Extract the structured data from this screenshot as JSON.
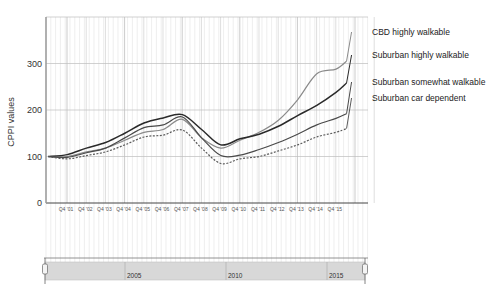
{
  "chart_data": {
    "type": "line",
    "title": "",
    "xlabel": "",
    "ylabel": "CPPI values",
    "ylim": [
      0,
      400
    ],
    "yticks": [
      0,
      100,
      200,
      300
    ],
    "grid": true,
    "legend_position": "right, inline at line ends",
    "x": [
      "Q4 '00",
      "Q4 '01",
      "Q4 '02",
      "Q4 '03",
      "Q4 '04",
      "Q4 '05",
      "Q4 '06",
      "Q4 '07",
      "Q4 '08",
      "Q4 '09",
      "Q4 '10",
      "Q4 '11",
      "Q4 '12",
      "Q4 '13",
      "Q4 '14",
      "Q4 '15",
      "Q2 '16"
    ],
    "xtick_labels": [
      "Q4 '01",
      "Q4 '02",
      "Q4 '03",
      "Q4 '04",
      "Q4 '05",
      "Q4 '06",
      "Q4 '07",
      "Q4 '08",
      "Q4 '09",
      "Q4 '10",
      "Q4 '11",
      "Q4 '12",
      "Q4 '13",
      "Q4 '14",
      "Q4 '15"
    ],
    "series": [
      {
        "name": "CBD highly walkable",
        "style": "solid",
        "color": "#8a8a8a",
        "values": [
          100,
          100,
          110,
          118,
          135,
          152,
          158,
          180,
          140,
          118,
          135,
          152,
          178,
          222,
          278,
          288,
          305
        ]
      },
      {
        "name": "Suburban highly walkable",
        "style": "solid",
        "color": "#2a2a2a",
        "values": [
          100,
          104,
          118,
          130,
          150,
          172,
          183,
          190,
          158,
          125,
          138,
          148,
          165,
          188,
          210,
          238,
          258
        ]
      },
      {
        "name": "Suburban somewhat walkable",
        "style": "solid",
        "color": "#4a4a4a",
        "values": [
          100,
          98,
          108,
          118,
          140,
          162,
          168,
          185,
          140,
          102,
          103,
          115,
          130,
          148,
          168,
          182,
          192
        ]
      },
      {
        "name": "Suburban car dependent",
        "style": "dashed",
        "color": "#5a5a5a",
        "values": [
          100,
          95,
          102,
          110,
          125,
          142,
          146,
          157,
          118,
          85,
          95,
          100,
          112,
          125,
          142,
          152,
          160
        ]
      }
    ]
  },
  "timeline": {
    "labels": [
      "2005",
      "2010",
      "2015"
    ],
    "left_handle": "range-start-handle",
    "right_handle": "range-end-handle"
  }
}
